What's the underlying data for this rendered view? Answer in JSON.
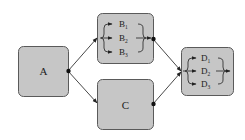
{
  "diagram": {
    "nodes": {
      "a": {
        "label": "A"
      },
      "b": {
        "label": "B",
        "items": [
          {
            "label": "B",
            "sub": "1"
          },
          {
            "label": "B",
            "sub": "2"
          },
          {
            "label": "B",
            "sub": "3"
          }
        ]
      },
      "c": {
        "label": "C"
      },
      "d": {
        "label": "D",
        "items": [
          {
            "label": "D",
            "sub": "1"
          },
          {
            "label": "D",
            "sub": "2"
          },
          {
            "label": "D",
            "sub": "3"
          }
        ]
      }
    },
    "edges": [
      {
        "from": "A",
        "to": "B"
      },
      {
        "from": "A",
        "to": "C"
      },
      {
        "from": "B",
        "to": "D"
      },
      {
        "from": "C",
        "to": "D"
      }
    ],
    "colors": {
      "box_fill": "#c6c6c6",
      "box_stroke": "#5a5a5a",
      "line": "#333333"
    }
  }
}
